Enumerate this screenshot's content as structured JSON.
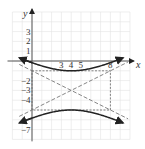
{
  "chart_data": {
    "type": "line",
    "title": "",
    "xlabel": "x",
    "ylabel": "y",
    "xlim": [
      -2,
      10
    ],
    "ylim": [
      -8,
      5
    ],
    "grid": true,
    "x_tick_labels": [
      "3",
      "4",
      "5",
      "8"
    ],
    "y_tick_labels": [
      "3",
      "2",
      "1",
      "-2",
      "-3",
      "-4",
      "-7"
    ],
    "hyperbola": {
      "center": [
        4,
        -3
      ],
      "vertices": [
        [
          4,
          -1
        ],
        [
          4,
          -5
        ]
      ],
      "a": 2,
      "b": 4,
      "orientation": "vertical",
      "equation": "(y+3)^2/4 - (x-4)^2/16 = 1"
    },
    "asymptotes": [
      {
        "slope": 0.5,
        "passes_through": [
          4,
          -3
        ],
        "style": "dashed"
      },
      {
        "slope": -0.5,
        "passes_through": [
          4,
          -3
        ],
        "style": "dashed"
      }
    ],
    "fundamental_rectangle": {
      "x": [
        0,
        8
      ],
      "y": [
        -5,
        -1
      ],
      "style": "dashed"
    }
  },
  "labels": {
    "x_axis": "x",
    "y_axis": "y",
    "xticks": [
      {
        "v": 3,
        "t": "3"
      },
      {
        "v": 4,
        "t": "4"
      },
      {
        "v": 5,
        "t": "5"
      },
      {
        "v": 8,
        "t": "8"
      }
    ],
    "yticks": [
      {
        "v": 3,
        "t": "3"
      },
      {
        "v": 2,
        "t": "2"
      },
      {
        "v": 1,
        "t": "1"
      },
      {
        "v": -2,
        "t": "−2"
      },
      {
        "v": -3,
        "t": "−3"
      },
      {
        "v": -4,
        "t": "−4"
      },
      {
        "v": -7,
        "t": "−7"
      }
    ]
  }
}
